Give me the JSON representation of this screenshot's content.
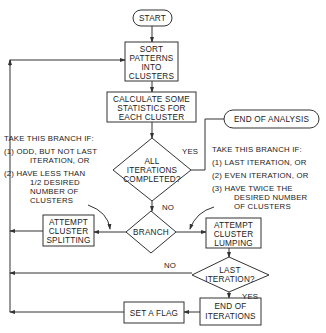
{
  "nodes": {
    "start": {
      "label": "START"
    },
    "sort": {
      "lines": [
        "SORT",
        "PATTERNS",
        "INTO",
        "CLUSTERS"
      ]
    },
    "calculate": {
      "lines": [
        "CALCULATE SOME",
        "STATISTICS FOR",
        "EACH CLUSTER"
      ]
    },
    "all_iterations": {
      "lines": [
        "ALL",
        "ITERATIONS",
        "COMPLETED?"
      ]
    },
    "end_analysis": {
      "label": "END OF ANALYSIS"
    },
    "branch": {
      "label": "BRANCH"
    },
    "splitting": {
      "lines": [
        "ATTEMPT",
        "CLUSTER",
        "SPLITTING"
      ]
    },
    "lumping": {
      "lines": [
        "ATTEMPT",
        "CLUSTER",
        "LUMPING"
      ]
    },
    "last_iteration": {
      "lines": [
        "LAST",
        "ITERATION?"
      ]
    },
    "end_iterations": {
      "lines": [
        "END OF",
        "ITERATIONS"
      ]
    },
    "set_flag": {
      "label": "SET A FLAG"
    }
  },
  "edge_labels": {
    "yes_all": "YES",
    "no_all": "NO",
    "no_last": "NO",
    "yes_last": "YES"
  },
  "annotations": {
    "left": {
      "lines": [
        "TAKE THIS BRANCH IF:",
        "(1) ODD, BUT NOT LAST",
        "ITERATION, OR",
        "(2) HAVE LESS THAN",
        "1/2 DESIRED",
        "NUMBER OF",
        "CLUSTERS"
      ]
    },
    "right": {
      "lines": [
        "TAKE THIS BRANCH IF:",
        "(1) LAST ITERATION, OR",
        "(2) EVEN ITERATION, OR",
        "(3) HAVE TWICE THE",
        "DESIRED NUMBER",
        "OF CLUSTERS"
      ]
    }
  }
}
